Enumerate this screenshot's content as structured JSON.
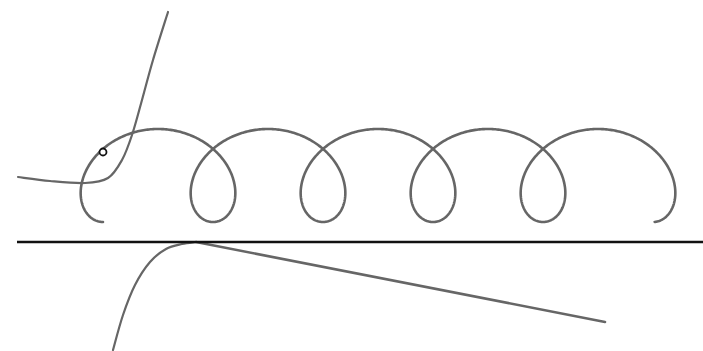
{
  "figure": {
    "width": 703,
    "height": 351,
    "background": "#ffffff",
    "colors": {
      "curve": "#666666",
      "ground_line": "#111111",
      "marker_stroke": "#111111",
      "marker_fill": "#ffffff"
    },
    "ground_line": {
      "x1": 17,
      "y1": 242,
      "x2": 703,
      "y2": 242,
      "stroke_width": 2.6
    },
    "trochoid": {
      "description": "looping curve (prolate trochoid) with 5 arches and 4 loops",
      "x_start": 103,
      "x_end": 652,
      "loop_period": 110,
      "y_top": 129,
      "y_bottom": 222,
      "stroke_width": 2.6
    },
    "rising_curve": {
      "description": "curve rising steeply from left toward top",
      "points": [
        [
          18,
          177
        ],
        [
          50,
          181
        ],
        [
          85,
          183
        ],
        [
          108,
          178
        ],
        [
          122,
          160
        ],
        [
          132,
          135
        ],
        [
          142,
          100
        ],
        [
          153,
          60
        ],
        [
          168,
          12
        ]
      ],
      "stroke_width": 2.2
    },
    "lower_curve": {
      "description": "curve rising from bottom, tangent to the ground line",
      "points": [
        [
          113,
          350
        ],
        [
          123,
          315
        ],
        [
          135,
          285
        ],
        [
          150,
          262
        ],
        [
          166,
          249
        ],
        [
          182,
          244
        ],
        [
          196,
          242
        ]
      ],
      "stroke_width": 2.2
    },
    "tangent_line": {
      "x1": 196,
      "y1": 242,
      "x2": 605,
      "y2": 322,
      "stroke_width": 2.6
    },
    "marker": {
      "cx": 103,
      "cy": 152,
      "r": 3.5,
      "stroke_width": 1.8
    }
  }
}
